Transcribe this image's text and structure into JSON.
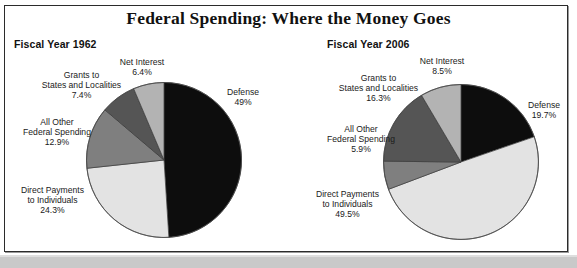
{
  "title": "Federal Spending: Where the Money Goes",
  "panels": [
    {
      "heading": "Fiscal Year 1962"
    },
    {
      "heading": "Fiscal Year 2006"
    }
  ],
  "labels_1962": {
    "net_interest": {
      "line1": "Net Interest",
      "pct": "6.4%"
    },
    "grants": {
      "line1": "Grants to",
      "line2": "States and Localities",
      "pct": "7.4%"
    },
    "all_other": {
      "line1": "All Other",
      "line2": "Federal Spending",
      "pct": "12.9%"
    },
    "direct_payments": {
      "line1": "Direct Payments",
      "line2": "to Individuals",
      "pct": "24.3%"
    },
    "defense": {
      "line1": "Defense",
      "pct": "49%"
    }
  },
  "labels_2006": {
    "net_interest": {
      "line1": "Net Interest",
      "pct": "8.5%"
    },
    "grants": {
      "line1": "Grants to",
      "line2": "States and Localities",
      "pct": "16.3%"
    },
    "all_other": {
      "line1": "All Other",
      "line2": "Federal Spending",
      "pct": "5.9%"
    },
    "direct_payments": {
      "line1": "Direct Payments",
      "line2": "to Individuals",
      "pct": "49.5%"
    },
    "defense": {
      "line1": "Defense",
      "pct": "19.7%"
    }
  },
  "colors": {
    "defense": "#0d0d0d",
    "direct_payments": "#e3e3e3",
    "all_other": "#7f7f7f",
    "grants": "#555555",
    "net_interest": "#b3b3b3",
    "slice_stroke": "#3a3a3a",
    "frame_border": "#2b2b2b",
    "band": "#c9c9c9",
    "text": "#111111"
  },
  "chart_data": [
    {
      "type": "pie",
      "title": "Fiscal Year 1962",
      "categories": [
        "Defense",
        "Direct Payments to Individuals",
        "All Other Federal Spending",
        "Grants to States and Localities",
        "Net Interest"
      ],
      "values": [
        49.0,
        24.3,
        12.9,
        7.4,
        6.4
      ],
      "value_labels": [
        "49%",
        "24.3%",
        "12.9%",
        "7.4%",
        "6.4%"
      ],
      "colors": [
        "#0d0d0d",
        "#e3e3e3",
        "#7f7f7f",
        "#555555",
        "#b3b3b3"
      ],
      "units": "percent of total federal spending",
      "start_angle_deg": 0,
      "direction": "clockwise",
      "legend": "none (direct labels with leader placement)"
    },
    {
      "type": "pie",
      "title": "Fiscal Year 2006",
      "categories": [
        "Defense",
        "Direct Payments to Individuals",
        "All Other Federal Spending",
        "Grants to States and Localities",
        "Net Interest"
      ],
      "values": [
        19.7,
        49.5,
        5.9,
        16.3,
        8.5
      ],
      "value_labels": [
        "19.7%",
        "49.5%",
        "5.9%",
        "16.3%",
        "8.5%"
      ],
      "colors": [
        "#0d0d0d",
        "#e3e3e3",
        "#7f7f7f",
        "#555555",
        "#b3b3b3"
      ],
      "units": "percent of total federal spending",
      "start_angle_deg": 0,
      "direction": "clockwise",
      "legend": "none (direct labels with leader placement)"
    }
  ],
  "figure_title": "Federal Spending: Where the Money Goes"
}
